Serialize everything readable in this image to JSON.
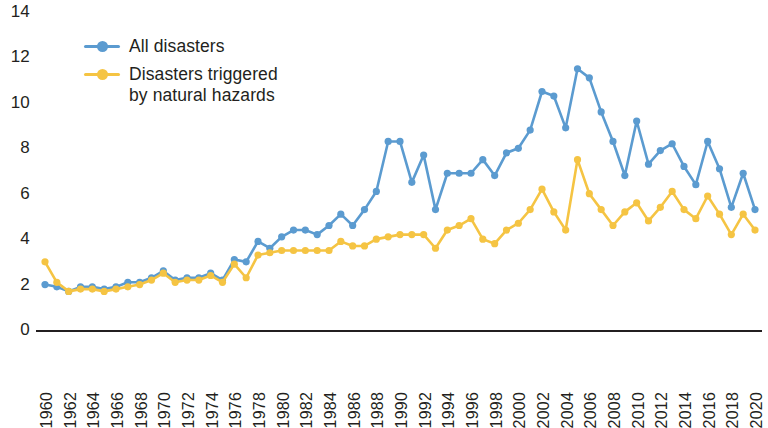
{
  "chart_data": {
    "type": "line",
    "title": "",
    "subtitle": "",
    "xlabel": "",
    "ylabel": "",
    "ylim": [
      0,
      14
    ],
    "xlim": [
      1960,
      2020
    ],
    "y_ticks": [
      0,
      2,
      4,
      6,
      8,
      10,
      12,
      14
    ],
    "x_ticks": [
      1960,
      1962,
      1964,
      1966,
      1968,
      1970,
      1972,
      1974,
      1976,
      1978,
      1980,
      1982,
      1984,
      1986,
      1988,
      1990,
      1992,
      1994,
      1996,
      1998,
      2000,
      2002,
      2004,
      2006,
      2008,
      2010,
      2012,
      2014,
      2016,
      2018,
      2020
    ],
    "x_tick_labels": [
      "1960",
      "1962",
      "1964",
      "1966",
      "1968",
      "1970",
      "1972",
      "1974",
      "1976",
      "1978",
      "1980",
      "1982",
      "1984",
      "1986",
      "1988",
      "1990",
      "1992",
      "1994",
      "1996",
      "1998",
      "2000",
      "2002",
      "2004",
      "2006",
      "2008",
      "2010",
      "2012",
      "2014",
      "2016",
      "2018",
      "2020"
    ],
    "y_tick_labels": [
      "0",
      "2",
      "4",
      "6",
      "8",
      "10",
      "12",
      "14"
    ],
    "grid": false,
    "legend_position": "top-left-inside",
    "x": [
      1960,
      1961,
      1962,
      1963,
      1964,
      1965,
      1966,
      1967,
      1968,
      1969,
      1970,
      1971,
      1972,
      1973,
      1974,
      1975,
      1976,
      1977,
      1978,
      1979,
      1980,
      1981,
      1982,
      1983,
      1984,
      1985,
      1986,
      1987,
      1988,
      1989,
      1990,
      1991,
      1992,
      1993,
      1994,
      1995,
      1996,
      1997,
      1998,
      1999,
      2000,
      2001,
      2002,
      2003,
      2004,
      2005,
      2006,
      2007,
      2008,
      2009,
      2010,
      2011,
      2012,
      2013,
      2014,
      2015,
      2016,
      2017,
      2018,
      2019,
      2020
    ],
    "series": [
      {
        "name": "All disasters",
        "color": "#5b9bd0",
        "marker": "circle",
        "values": [
          2.0,
          1.9,
          1.7,
          1.9,
          1.9,
          1.8,
          1.9,
          2.1,
          2.1,
          2.3,
          2.6,
          2.2,
          2.3,
          2.3,
          2.5,
          2.2,
          3.1,
          3.0,
          3.9,
          3.6,
          4.1,
          4.4,
          4.4,
          4.2,
          4.6,
          5.1,
          4.6,
          5.3,
          6.1,
          8.3,
          8.3,
          6.5,
          7.7,
          5.3,
          6.9,
          6.9,
          6.9,
          7.5,
          6.8,
          7.8,
          8.0,
          8.8,
          10.5,
          10.3,
          8.9,
          11.5,
          11.1,
          9.6,
          8.3,
          6.8,
          9.2,
          7.3,
          7.9,
          8.2,
          7.2,
          6.4,
          8.3,
          7.1,
          5.4,
          6.9,
          5.3
        ]
      },
      {
        "name": "Disasters triggered\nby natural hazards",
        "color": "#f5c443",
        "marker": "circle",
        "values": [
          3.0,
          2.1,
          1.7,
          1.8,
          1.8,
          1.7,
          1.8,
          1.9,
          2.0,
          2.2,
          2.5,
          2.1,
          2.2,
          2.2,
          2.4,
          2.1,
          2.9,
          2.3,
          3.3,
          3.4,
          3.5,
          3.5,
          3.5,
          3.5,
          3.5,
          3.9,
          3.7,
          3.7,
          4.0,
          4.1,
          4.2,
          4.2,
          4.2,
          3.6,
          4.4,
          4.6,
          4.9,
          4.0,
          3.8,
          4.4,
          4.7,
          5.3,
          6.2,
          5.2,
          4.4,
          7.5,
          6.0,
          5.3,
          4.6,
          5.2,
          5.6,
          4.8,
          5.4,
          6.1,
          5.3,
          4.9,
          5.9,
          5.1,
          4.2,
          5.1,
          4.4
        ]
      }
    ]
  },
  "legend": {
    "entries": [
      {
        "label": "All disasters",
        "color": "#5b9bd0"
      },
      {
        "label": "Disasters triggered\nby natural hazards",
        "color": "#f5c443"
      }
    ]
  },
  "axes": {
    "axis_line_color": "#231f20"
  }
}
